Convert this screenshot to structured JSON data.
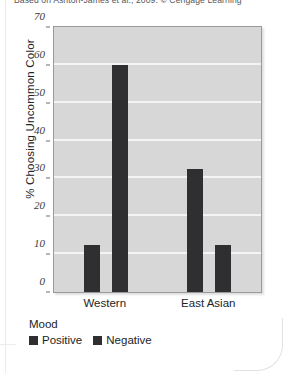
{
  "caption": "Based on Ashton-James et al., 2009. © Cengage Learning",
  "chart_data": {
    "type": "bar",
    "title": "",
    "xlabel": "",
    "ylabel": "% Choosing Uncommon Color",
    "categories": [
      "Western",
      "East Asian"
    ],
    "series": [
      {
        "name": "Positive",
        "values": [
          12.5,
          32.5
        ],
        "color": "#2f2f31"
      },
      {
        "name": "Negative",
        "values": [
          60,
          12.5
        ],
        "color": "#2f2f31"
      }
    ],
    "ylim": [
      0,
      70
    ],
    "yticks": [
      0,
      10,
      20,
      30,
      40,
      50,
      60,
      70
    ],
    "ytick_labels": [
      "0",
      "10",
      "20",
      "30",
      "40",
      "50",
      "60",
      "70"
    ],
    "grid": true,
    "legend_title": "Mood",
    "legend_position": "below-left",
    "plot_background": "#d7d7d7",
    "gridline_color": "#f4f4f4"
  }
}
